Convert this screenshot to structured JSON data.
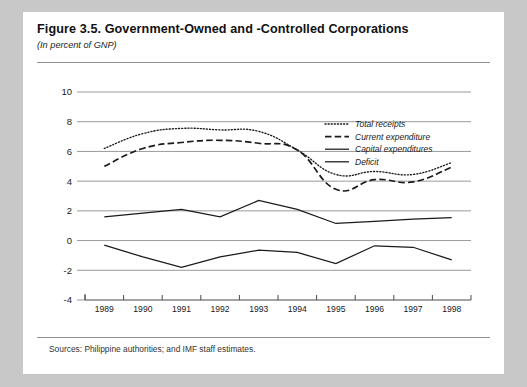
{
  "figure": {
    "title": "Figure 3.5.  Government-Owned and -Controlled Corporations",
    "subtitle": "(In percent of GNP)",
    "source": "Sources:  Philippine authorities; and IMF staff estimates."
  },
  "chart_data": {
    "type": "line",
    "title": "Figure 3.5.  Government-Owned and -Controlled Corporations",
    "subtitle": "(In percent of GNP)",
    "xlabel": "",
    "ylabel": "",
    "ylim": [
      -4,
      10
    ],
    "yticks": [
      "10",
      "8",
      "6",
      "4",
      "2",
      "0",
      "-2",
      "-4"
    ],
    "ytick_values": [
      10,
      8,
      6,
      4,
      2,
      0,
      -2,
      -4
    ],
    "grid": true,
    "legend_position": "upper-right",
    "categories": [
      "1989",
      "1990",
      "1991",
      "1992",
      "1993",
      "1994",
      "1995",
      "1996",
      "1997",
      "1998"
    ],
    "x": [
      1989,
      1990,
      1991,
      1992,
      1993,
      1994,
      1995,
      1996,
      1997,
      1998
    ],
    "series": [
      {
        "name": "Total receipts",
        "style": "dotted",
        "values": [
          6.2,
          7.2,
          7.55,
          7.45,
          7.35,
          6.1,
          4.45,
          4.65,
          4.45,
          5.25
        ]
      },
      {
        "name": "Current expenditure",
        "style": "dashed",
        "values": [
          5.0,
          6.2,
          6.6,
          6.75,
          6.55,
          6.1,
          3.45,
          4.1,
          3.95,
          4.95
        ]
      },
      {
        "name": "Capital expenditures",
        "style": "solid-thin",
        "values": [
          1.6,
          1.85,
          2.1,
          1.6,
          2.7,
          2.1,
          1.15,
          1.3,
          1.45,
          1.55
        ]
      },
      {
        "name": "Deficit",
        "style": "solid",
        "values": [
          -0.3,
          -1.1,
          -1.8,
          -1.1,
          -0.65,
          -0.8,
          -1.55,
          -0.35,
          -0.45,
          -1.3
        ]
      }
    ]
  },
  "legend": {
    "items": [
      {
        "label": "Total receipts",
        "style": "dotted"
      },
      {
        "label": "Current expenditure",
        "style": "dashed"
      },
      {
        "label": "Capital expenditures",
        "style": "solid-thin"
      },
      {
        "label": "Deficit",
        "style": "solid"
      }
    ]
  }
}
